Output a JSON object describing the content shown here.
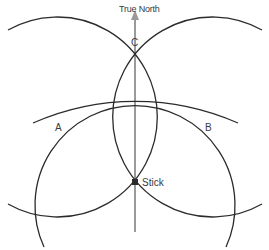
{
  "diagram": {
    "north_label": "True North",
    "points": {
      "A": {
        "label": "A"
      },
      "B": {
        "label": "B"
      },
      "C": {
        "label": "C"
      },
      "Stick": {
        "label": "Stick"
      }
    },
    "colors": {
      "arc": "#2b2b2b",
      "north_line": "#9a9a9a",
      "text": "#3a3a3a",
      "background": "#ffffff"
    }
  }
}
